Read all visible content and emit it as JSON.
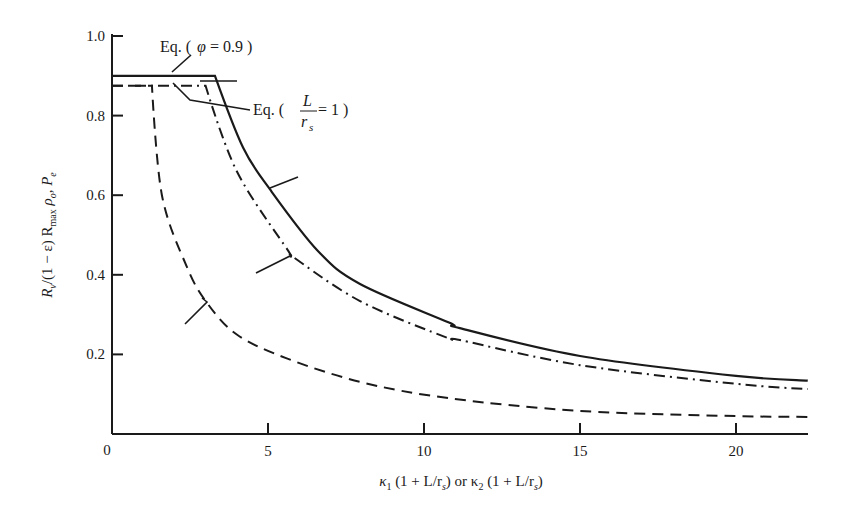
{
  "chart_data": {
    "type": "line",
    "title": "",
    "xlabel": "κ1 (1 + L/rs) or κ2 (1 + L/rs)",
    "ylabel": "Rv/(1 − ε) Rmax ρo, Pe",
    "xlim": [
      0,
      22.3
    ],
    "ylim": [
      0,
      1.0
    ],
    "grid": false,
    "legend": "none (curves identified by leader lines)",
    "x_ticks": [
      0,
      5,
      10,
      15,
      20
    ],
    "x_tick_labels": [
      "0",
      "5",
      "10",
      "15",
      "20"
    ],
    "y_ticks": [
      0.2,
      0.4,
      0.6,
      0.8,
      1.0
    ],
    "y_tick_labels": [
      "0.2",
      "0.4",
      "0.6",
      "0.8",
      "1.0"
    ],
    "series": [
      {
        "name": "solid",
        "style": "solid",
        "x": [
          0,
          3.3,
          4.2,
          5.06,
          6.6,
          7.95,
          10.8,
          11.15,
          15,
          20,
          22.3
        ],
        "y": [
          0.9,
          0.9,
          0.72,
          0.615,
          0.46,
          0.377,
          0.28,
          0.266,
          0.196,
          0.146,
          0.134
        ]
      },
      {
        "name": "dash-dot",
        "style": "dashdot",
        "x": [
          0,
          3.0,
          4.0,
          5.65,
          5.77,
          7.95,
          10.8,
          11.15,
          15,
          20,
          22.3
        ],
        "y": [
          0.875,
          0.875,
          0.66,
          0.46,
          0.447,
          0.334,
          0.24,
          0.236,
          0.173,
          0.126,
          0.113
        ]
      },
      {
        "name": "dashed",
        "style": "dashed",
        "x": [
          0,
          1.28,
          1.6,
          2.4,
          3.04,
          4.0,
          5.6,
          8.0,
          10.8,
          15,
          20,
          22.3
        ],
        "y": [
          0.875,
          0.875,
          0.6,
          0.42,
          0.33,
          0.25,
          0.19,
          0.13,
          0.09,
          0.058,
          0.045,
          0.043
        ]
      }
    ],
    "annotations": [
      {
        "text": "Eq. ( φ = 0.9 )",
        "points_to": "solid horizontal segment at 0.9"
      },
      {
        "text": "Eq. ( L/rs = 1 )",
        "points_to": "dashed horizontal segment at 0.875"
      }
    ]
  },
  "labels": {
    "x_axis": {
      "k1": "κ",
      "sub1": "1",
      "mid": " (1 + L/r",
      "subs": "s",
      "or": ") or κ",
      "sub2": "2",
      "mid2": " (1 + L/r",
      "subs2": "s",
      "end": ")"
    },
    "y_axis": {
      "R": "R",
      "v": "v",
      "part1": "/(1 − ε) R",
      "max": "max",
      "rho": " ρ",
      "o": "o",
      "comma": ", P",
      "e": "e"
    },
    "ann_phi": {
      "prefix": "Eq. (",
      "phi": "φ",
      "rest": " = 0.9 )"
    },
    "ann_L": {
      "prefix": "Eq. (",
      "num": "L",
      "den": "r",
      "den_sub": "s",
      "rest": "= 1 )"
    },
    "origin": "0"
  }
}
